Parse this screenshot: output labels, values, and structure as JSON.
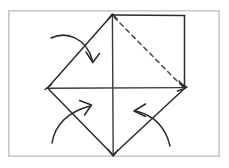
{
  "figure": {
    "width": 229,
    "height": 168,
    "background_color": "#ffffff"
  },
  "frame": {
    "name": "diagram-border",
    "x": 8,
    "y": 10,
    "width": 212,
    "height": 147,
    "stroke_color": "#c9c9c9"
  },
  "colors": {
    "ink": "#2b2b2b",
    "hidden_edge": "#4a4a4a",
    "frame": "#c9c9c9",
    "paper": "#ffffff"
  },
  "vertices": {
    "top": {
      "label": "top-vertex",
      "x": 112,
      "y": 15
    },
    "right_top": {
      "label": "square-top-right-corner",
      "x": 184,
      "y": 15
    },
    "right_bottom": {
      "label": "square-bottom-right-corner",
      "x": 184,
      "y": 88
    },
    "left": {
      "label": "left-vertex",
      "x": 48,
      "y": 88
    },
    "bottom": {
      "label": "bottom-vertex",
      "x": 113,
      "y": 155
    },
    "center": {
      "label": "center-point",
      "x": 113,
      "y": 88
    }
  },
  "shapes": {
    "square_top_edge": {
      "name": "square-top-edge",
      "path": "M 112 15 L 184 15"
    },
    "square_right_edge": {
      "name": "square-right-edge",
      "path": "M 184 15 L 184 88"
    },
    "upper_left_diagonal": {
      "name": "upper-left-fold-edge",
      "path": "M 112 15 L 48 88"
    },
    "lower_left_diagonal": {
      "name": "lower-left-fold-edge",
      "path": "M 48 88 L 113 155"
    },
    "lower_right_diagonal": {
      "name": "lower-right-fold-edge",
      "path": "M 113 155 L 184 88"
    },
    "horizontal_crease": {
      "name": "horizontal-crease-line",
      "path": "M 48 88 L 185 88"
    },
    "vertical_crease": {
      "name": "vertical-crease-line",
      "path": "M 112.5 15 L 113 155"
    },
    "hidden_diagonal": {
      "name": "hidden-diagonal-dashed-edge",
      "path": "M 114 17 L 183 87"
    }
  },
  "arrows": [
    {
      "name": "fold-arrow-top-left",
      "direction": "down-right",
      "curve": "M 51 38 C 66 32, 85 38, 92 60",
      "head": "M 86 52 L 92 62 L 99 54"
    },
    {
      "name": "fold-arrow-bottom-left",
      "direction": "up-right",
      "curve": "M 52 143 C 56 126, 68 112, 91 106",
      "head": "M 80 101 L 92 105 L 85 115"
    },
    {
      "name": "fold-arrow-bottom-right",
      "direction": "up-left",
      "curve": "M 170 146 C 166 130, 156 116, 136 111",
      "head": "M 145 104 L 134 111 L 145 117"
    }
  ],
  "arrow_count": 3
}
